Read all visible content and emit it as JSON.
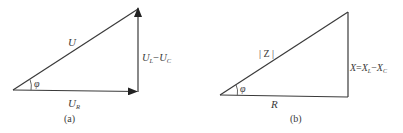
{
  "panels": [
    {
      "id": "a",
      "caption": "(a)",
      "title": "Voltage triangle",
      "hypotenuse_label": "U",
      "base_label_main": "U",
      "base_label_sub": "R",
      "vertical_label": {
        "part1_main": "U",
        "part1_sub": "L",
        "minus": "−",
        "part2_main": "U",
        "part2_sub": "C"
      },
      "angle_label": "φ"
    },
    {
      "id": "b",
      "caption": "(b)",
      "title": "Impedance triangle",
      "hypotenuse_label": "| Z |",
      "base_label": "R",
      "vertical_label": {
        "lhs": "X",
        "equals": "=",
        "part1_main": "X",
        "part1_sub": "L",
        "minus": "−",
        "part2_main": "X",
        "part2_sub": "C"
      },
      "angle_label": "φ"
    }
  ],
  "colors": {
    "stroke": "#3a3a3a",
    "text": "#3a3a3a",
    "background": "#ffffff"
  }
}
